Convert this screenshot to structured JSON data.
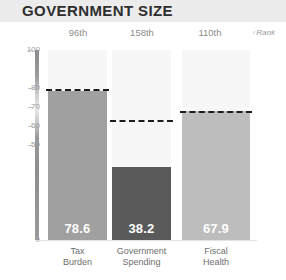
{
  "header": {
    "title": "GOVERNMENT SIZE"
  },
  "annotation": {
    "caret": "‹",
    "rank_note": "Rank"
  },
  "axis": {
    "ticks": [
      {
        "label": "100",
        "value": 100
      },
      {
        "label": "80",
        "value": 80
      },
      {
        "label": "70",
        "value": 70
      },
      {
        "label": "60",
        "value": 60
      },
      {
        "label": "50",
        "value": 50
      },
      {
        "label": "0",
        "value": 0
      }
    ]
  },
  "colors": {
    "title_band": "#ececec",
    "bar_track": "#f7f7f7",
    "bar_tax_burden": "#a0a0a0",
    "bar_government_spending": "#5a5a5a",
    "bar_fiscal_health": "#bdbdbd",
    "dashed_line": "#1d1d1d",
    "tick_text": "#9e9e9e",
    "caption_text": "#6e6e6e"
  },
  "chart_data": {
    "type": "bar",
    "title": "GOVERNMENT SIZE",
    "xlabel": "",
    "ylabel": "",
    "ylim": [
      0,
      100
    ],
    "grid": false,
    "legend": "none",
    "categories": [
      "Tax Burden",
      "Government Spending",
      "Fiscal Health"
    ],
    "values": [
      78.6,
      38.2,
      67.9
    ],
    "value_labels": [
      "78.6",
      "38.2",
      "67.9"
    ],
    "ranks": [
      "96th",
      "158th",
      "110th"
    ],
    "reference_markers": [
      78.6,
      62.0,
      67.0
    ],
    "bars": [
      {
        "category": "Tax Burden",
        "caption_line1": "Tax",
        "caption_line2": "Burden",
        "value": 78.6,
        "value_label": "78.6",
        "rank": "96th",
        "reference": 78.6,
        "color": "#a0a0a0"
      },
      {
        "category": "Government Spending",
        "caption_line1": "Government",
        "caption_line2": "Spending",
        "value": 38.2,
        "value_label": "38.2",
        "rank": "158th",
        "reference": 62.0,
        "color": "#5a5a5a"
      },
      {
        "category": "Fiscal Health",
        "caption_line1": "Fiscal",
        "caption_line2": "Health",
        "value": 67.9,
        "value_label": "67.9",
        "rank": "110th",
        "reference": 67.0,
        "color": "#bdbdbd"
      }
    ]
  }
}
